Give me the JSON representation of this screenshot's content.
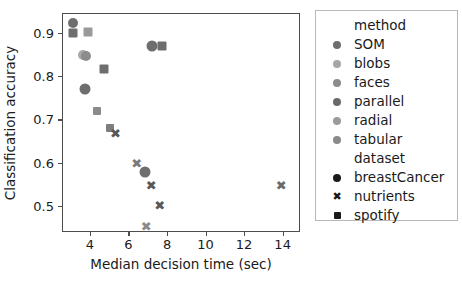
{
  "chart_data": {
    "type": "scatter",
    "title": "",
    "xlabel": "Median decision time (sec)",
    "ylabel": "Classification accuracy",
    "xlim": [
      2.55,
      14.9
    ],
    "ylim": [
      0.44,
      0.945
    ],
    "xticks": [
      4,
      6,
      8,
      10,
      12,
      14
    ],
    "yticks": [
      0.5,
      0.6,
      0.7,
      0.8,
      0.9
    ],
    "xticklabels": [
      "4",
      "6",
      "8",
      "10",
      "12",
      "14"
    ],
    "yticklabels": [
      "0.5",
      "0.6",
      "0.7",
      "0.8",
      "0.9"
    ],
    "grid": false,
    "legend_position": "right-outside",
    "marker_size_px": 9,
    "points": [
      {
        "x": 3.12,
        "y": 0.922,
        "method": "SOM",
        "dataset": "breastCancer",
        "marker": "circle",
        "color": "#6e6e6e",
        "size": 10
      },
      {
        "x": 3.1,
        "y": 0.9,
        "method": "SOM",
        "dataset": "spotify",
        "marker": "square",
        "color": "#6e6e6e",
        "size": 9
      },
      {
        "x": 3.92,
        "y": 0.901,
        "method": "blobs",
        "dataset": "spotify",
        "marker": "square",
        "color": "#9a9a9a",
        "size": 9
      },
      {
        "x": 3.62,
        "y": 0.847,
        "method": "blobs",
        "dataset": "breastCancer",
        "marker": "circle",
        "color": "#a8a8a8",
        "size": 10
      },
      {
        "x": 3.78,
        "y": 0.845,
        "method": "radial",
        "dataset": "breastCancer",
        "marker": "circle",
        "color": "#8c8c8c",
        "size": 10
      },
      {
        "x": 4.72,
        "y": 0.815,
        "method": "faces",
        "dataset": "spotify",
        "marker": "square",
        "color": "#6e6e6e",
        "size": 9
      },
      {
        "x": 3.72,
        "y": 0.77,
        "method": "parallel",
        "dataset": "breastCancer",
        "marker": "circle",
        "color": "#6e6e6e",
        "size": 11
      },
      {
        "x": 4.38,
        "y": 0.72,
        "method": "tabular",
        "dataset": "spotify",
        "marker": "square",
        "color": "#8a8a8a",
        "size": 8
      },
      {
        "x": 5.02,
        "y": 0.68,
        "method": "radial",
        "dataset": "spotify",
        "marker": "square",
        "color": "#7d7d7d",
        "size": 8
      },
      {
        "x": 5.32,
        "y": 0.667,
        "method": "tabular",
        "dataset": "nutrients",
        "marker": "cross",
        "color": "#585858",
        "size": 10
      },
      {
        "x": 7.22,
        "y": 0.87,
        "method": "parallel",
        "dataset": "breastCancer",
        "marker": "circle",
        "color": "#6e6e6e",
        "size": 11
      },
      {
        "x": 7.72,
        "y": 0.87,
        "method": "parallel",
        "dataset": "spotify",
        "marker": "square",
        "color": "#6e6e6e",
        "size": 9
      },
      {
        "x": 6.42,
        "y": 0.598,
        "method": "faces",
        "dataset": "nutrients",
        "marker": "cross",
        "color": "#7b7b7b",
        "size": 10
      },
      {
        "x": 6.88,
        "y": 0.578,
        "method": "faces",
        "dataset": "breastCancer",
        "marker": "circle",
        "color": "#6e6e6e",
        "size": 11
      },
      {
        "x": 7.18,
        "y": 0.548,
        "method": "SOM",
        "dataset": "nutrients",
        "marker": "cross",
        "color": "#585858",
        "size": 10
      },
      {
        "x": 7.62,
        "y": 0.5,
        "method": "blobs",
        "dataset": "nutrients",
        "marker": "cross",
        "color": "#585858",
        "size": 10
      },
      {
        "x": 6.92,
        "y": 0.452,
        "method": "radial",
        "dataset": "nutrients",
        "marker": "cross",
        "color": "#8a8a8a",
        "size": 10
      },
      {
        "x": 13.92,
        "y": 0.548,
        "method": "parallel",
        "dataset": "nutrients",
        "marker": "cross",
        "color": "#6a6a6a",
        "size": 10
      }
    ],
    "legend": {
      "groups": [
        {
          "title": "method",
          "entries": [
            {
              "label": "SOM",
              "marker": "circle",
              "color": "#6e6e6e"
            },
            {
              "label": "blobs",
              "marker": "circle",
              "color": "#a6a6a6"
            },
            {
              "label": "faces",
              "marker": "circle",
              "color": "#8c8c8c"
            },
            {
              "label": "parallel",
              "marker": "circle",
              "color": "#6a6a6a"
            },
            {
              "label": "radial",
              "marker": "circle",
              "color": "#9b9b9b"
            },
            {
              "label": "tabular",
              "marker": "circle",
              "color": "#8a8a8a"
            }
          ]
        },
        {
          "title": "dataset",
          "entries": [
            {
              "label": "breastCancer",
              "marker": "circle",
              "color": "#1a1a1a"
            },
            {
              "label": "nutrients",
              "marker": "cross",
              "color": "#1a1a1a"
            },
            {
              "label": "spotify",
              "marker": "square",
              "color": "#1a1a1a"
            }
          ]
        }
      ]
    }
  },
  "colors": {
    "axis": "#4d4d4d",
    "text": "#1a1a1a",
    "legend_border": "#b8b8b8",
    "background": "#ffffff"
  }
}
